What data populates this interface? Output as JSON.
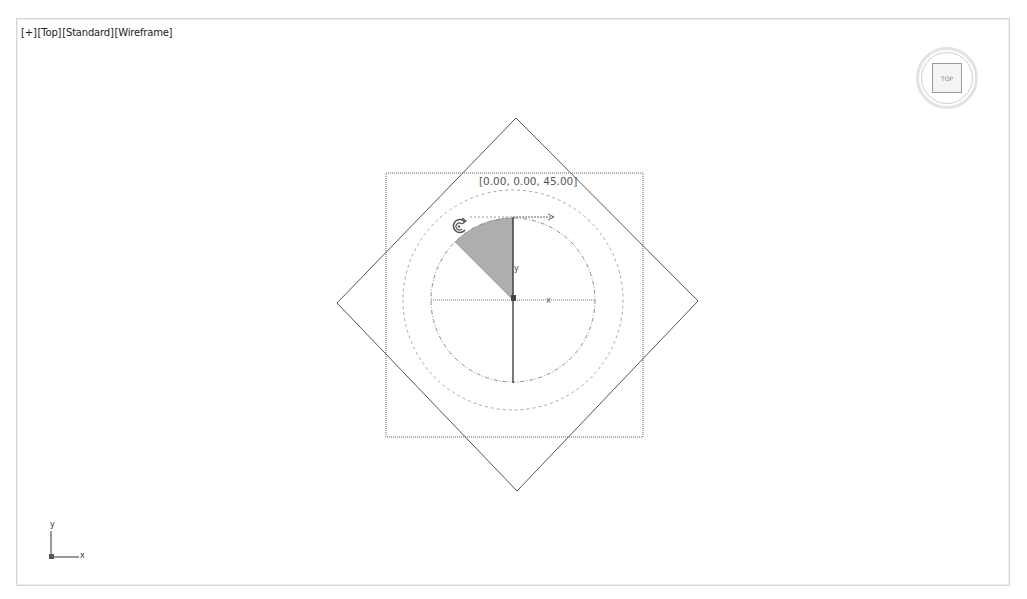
{
  "viewport": {
    "labels": {
      "plus": "[+]",
      "view": "[Top]",
      "shading": "[Standard]",
      "mode": "[Wireframe]"
    },
    "viewcube": {
      "face_label": "TOP"
    },
    "gizmo": {
      "type": "rotate",
      "coordinate_readout": "[0.00, 0.00, 45.00]",
      "axis_labels": {
        "x": "x",
        "y": "y",
        "z": "z"
      },
      "rotation_angle_deg": 45
    },
    "axis_tripod": {
      "x": "x",
      "y": "y",
      "z": "z"
    },
    "colors": {
      "background": "#ffffff",
      "wire": "#555555",
      "dashed": "#9a9a9a",
      "sector": "#9e9e9e",
      "border": "#d6d6d6"
    }
  }
}
